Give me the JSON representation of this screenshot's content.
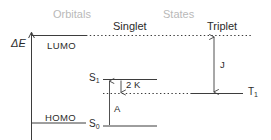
{
  "figure": {
    "type": "energy-level-diagram",
    "background_color": "#ffffff",
    "line_color": "#3d3d3d",
    "muted_text_color": "#b9b9b9",
    "text_color": "#2b2b2b"
  },
  "headers": {
    "orbitals": "Orbitals",
    "states": "States",
    "singlet": "Singlet",
    "triplet": "Triplet"
  },
  "axis": {
    "label": "ΔE"
  },
  "levels": {
    "lumo": "LUMO",
    "homo": "HOMO",
    "s1": "S",
    "s1_sub": "1",
    "s0": "S",
    "s0_sub": "0",
    "t1": "T",
    "t1_sub": "1"
  },
  "annotations": {
    "exchange": "2 K",
    "absorption": "A",
    "coupling": "J"
  }
}
